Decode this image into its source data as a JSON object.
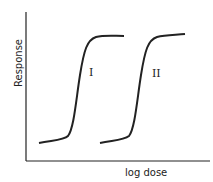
{
  "diagram": {
    "title": "",
    "y_axis_label": "Response",
    "x_axis_label": "log dose",
    "curves": [
      {
        "label": "I",
        "description": "Sigmoid dose-response curve (left)"
      },
      {
        "label": "II",
        "description": "Sigmoid dose-response curve shifted right"
      }
    ],
    "line_color": "#222222",
    "background": "#ffffff"
  }
}
